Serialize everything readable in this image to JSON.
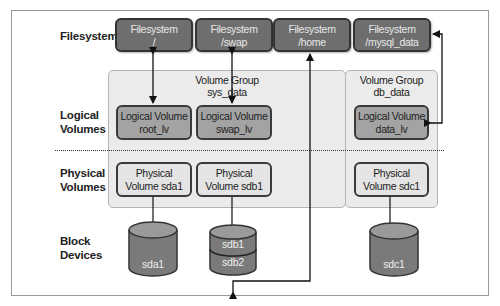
{
  "row_labels": {
    "filesystems": "Filesystems",
    "logical_volumes": [
      "Logical",
      "Volumes"
    ],
    "physical_volumes": [
      "Physical",
      "Volumes"
    ],
    "block_devices": [
      "Block",
      "Devices"
    ]
  },
  "filesystems": [
    {
      "title": "Filesystem",
      "mount": "/"
    },
    {
      "title": "Filesystem",
      "mount": "/swap"
    },
    {
      "title": "Filesystem",
      "mount": "/home"
    },
    {
      "title": "Filesystem",
      "mount": "/mysql_data"
    }
  ],
  "volume_groups": [
    {
      "title": "Volume Group",
      "name": "sys_data"
    },
    {
      "title": "Volume Group",
      "name": "db_data"
    }
  ],
  "logical_volumes": [
    {
      "title": "Logical Volume",
      "name": "root_lv"
    },
    {
      "title": "Logical Volume",
      "name": "swap_lv"
    },
    {
      "title": "Logical Volume",
      "name": "data_lv"
    }
  ],
  "physical_volumes": [
    {
      "line1": "Physical",
      "line2": "Volume sda1"
    },
    {
      "line1": "Physical",
      "line2": "Volume sdb1"
    },
    {
      "line1": "Physical",
      "line2": "Volume sdc1"
    }
  ],
  "block_devices": [
    {
      "name": "sda1"
    },
    {
      "name": "sdb1"
    },
    {
      "name": "sdb2"
    },
    {
      "name": "sdc1"
    }
  ],
  "colors": {
    "filesystem_fill": "#6e6e6e",
    "logical_volume_fill": "#a3a3a3",
    "physical_volume_fill": "#e4e4e4",
    "volume_group_fill": "#ebebeb",
    "cylinder_fill": "#7a7a7a"
  }
}
